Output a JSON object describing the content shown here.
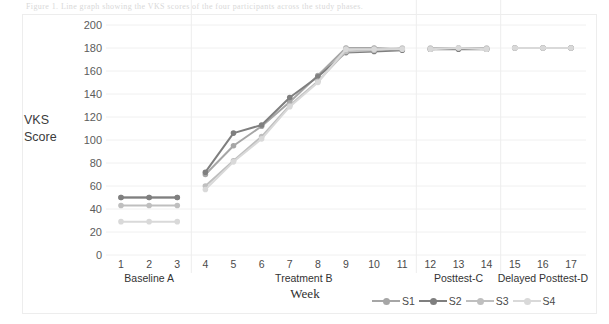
{
  "figure": {
    "top_caption": "Figure 1. Line graph showing the VKS scores of the four participants across the study phases."
  },
  "axis": {
    "y_title_line1": "VKS",
    "y_title_line2": "Score",
    "x_title": "Week",
    "y_ticks": [
      "200",
      "180",
      "160",
      "140",
      "120",
      "100",
      "80",
      "60",
      "40",
      "20",
      "0"
    ],
    "x_ticks": [
      "1",
      "2",
      "3",
      "4",
      "5",
      "6",
      "7",
      "8",
      "9",
      "10",
      "11",
      "12",
      "13",
      "14",
      "15",
      "16",
      "17"
    ]
  },
  "phases": [
    {
      "label": "Baseline A",
      "start_week": 1,
      "end_week": 3
    },
    {
      "label": "Treatment B",
      "start_week": 4,
      "end_week": 11
    },
    {
      "label": "Posttest-C",
      "start_week": 12,
      "end_week": 14
    },
    {
      "label": "Delayed Posttest-D",
      "start_week": 15,
      "end_week": 17
    }
  ],
  "legend": {
    "position": "bottom-right",
    "items": [
      {
        "label": "S1",
        "color": "#a6a6a6"
      },
      {
        "label": "S2",
        "color": "#7f7f7f"
      },
      {
        "label": "S3",
        "color": "#bfbfbf"
      },
      {
        "label": "S4",
        "color": "#d9d9d9"
      }
    ]
  },
  "chart_data": {
    "type": "line",
    "title": "",
    "subtitle": "",
    "xlabel": "Week",
    "ylabel": "VKS Score",
    "xlim": [
      1,
      17
    ],
    "ylim": [
      0,
      200
    ],
    "ytick_step": 20,
    "grid": "horizontal",
    "legend_position": "bottom-right",
    "x": [
      1,
      2,
      3,
      4,
      5,
      6,
      7,
      8,
      9,
      10,
      11,
      12,
      13,
      14,
      15,
      16,
      17
    ],
    "categories": [
      "1",
      "2",
      "3",
      "4",
      "5",
      "6",
      "7",
      "8",
      "9",
      "10",
      "11",
      "12",
      "13",
      "14",
      "15",
      "16",
      "17"
    ],
    "series": [
      {
        "name": "S1",
        "color": "#a6a6a6",
        "values": [
          50,
          50,
          50,
          70,
          95,
          112,
          133,
          156,
          180,
          180,
          179,
          179,
          180,
          179,
          180,
          180,
          180
        ]
      },
      {
        "name": "S2",
        "color": "#7f7f7f",
        "values": [
          50,
          50,
          50,
          72,
          106,
          113,
          137,
          155,
          176,
          177,
          178,
          179,
          179,
          179,
          180,
          180,
          180
        ]
      },
      {
        "name": "S3",
        "color": "#bfbfbf",
        "values": [
          43,
          43,
          43,
          60,
          82,
          103,
          130,
          151,
          177,
          178,
          180,
          180,
          180,
          180,
          180,
          180,
          180
        ]
      },
      {
        "name": "S4",
        "color": "#d9d9d9",
        "values": [
          29,
          29,
          29,
          57,
          81,
          101,
          129,
          150,
          179,
          179,
          179,
          179,
          180,
          179,
          180,
          180,
          180
        ]
      }
    ],
    "phase_separators": [
      3.5,
      11.5,
      14.5
    ],
    "annotations": [
      {
        "text": "Baseline A",
        "weeks": [
          1,
          3
        ]
      },
      {
        "text": "Treatment B",
        "weeks": [
          4,
          11
        ]
      },
      {
        "text": "Posttest-C",
        "weeks": [
          12,
          14
        ]
      },
      {
        "text": "Delayed Posttest-D",
        "weeks": [
          15,
          17
        ]
      }
    ]
  },
  "colors": {
    "gridline": "#f0f0f0",
    "separator": "#ededed",
    "frame": "#ededed",
    "text": "#4a4a4a"
  }
}
